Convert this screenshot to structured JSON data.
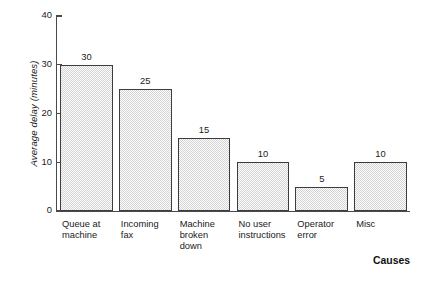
{
  "chart_data": {
    "type": "bar",
    "title": "",
    "subtitle": "",
    "xlabel": "Causes",
    "ylabel": "Average delay (minutes)",
    "categories": [
      "Queue at machine",
      "Incoming fax",
      "Machine broken down",
      "No user instructions",
      "Operator error",
      "Misc"
    ],
    "category_lines": [
      [
        "Queue at",
        "machine"
      ],
      [
        "Incoming",
        "fax"
      ],
      [
        "Machine",
        "broken",
        "down"
      ],
      [
        "No user",
        "instructions"
      ],
      [
        "Operator",
        "error"
      ],
      [
        "Misc"
      ]
    ],
    "values": [
      30,
      25,
      15,
      10,
      5,
      10
    ],
    "value_labels": [
      "30",
      "25",
      "15",
      "10",
      "5",
      "10"
    ],
    "ylim": [
      0,
      40
    ],
    "yticks": [
      0,
      10,
      20,
      30,
      40
    ],
    "ytick_labels": [
      "0",
      "10",
      "20",
      "30",
      "40"
    ],
    "xticks": [],
    "grid": false,
    "legend": null,
    "legend_position": "none",
    "bar_fill_color": "#d2d2d2",
    "bar_edge_color": "#3c3c3c",
    "axis_color": "#4a4a4a",
    "text_color": "#1a1a1a",
    "background_color": "#ffffff"
  }
}
